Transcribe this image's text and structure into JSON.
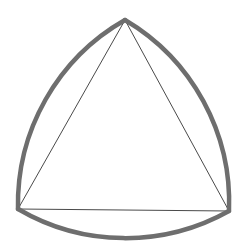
{
  "figure": {
    "background": "#ffffff",
    "arc_color": "#6e6e6e",
    "edge_color": "#4a4a4a",
    "vertices": {
      "top": [
        125,
        20
      ],
      "left": [
        18,
        209
      ],
      "right": [
        229,
        211
      ]
    },
    "arc_radius": 212
  }
}
